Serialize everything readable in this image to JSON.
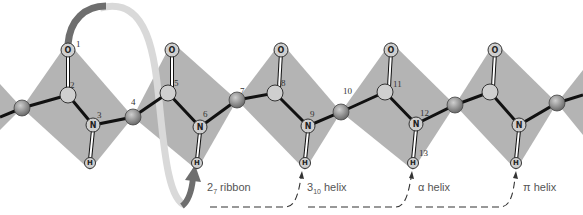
{
  "figure": {
    "atom_labels": {
      "oxygen": "O",
      "nitrogen": "N",
      "hydrogen": "H"
    },
    "atom_numbers": [
      "1",
      "2",
      "3",
      "4",
      "5",
      "6",
      "7",
      "8",
      "9",
      "10",
      "11",
      "12",
      "13"
    ],
    "structures": [
      {
        "name": "ribbon",
        "base": "2",
        "sub": "7",
        "suffix": " ribbon"
      },
      {
        "name": "helix-3-10",
        "base": "3",
        "sub": "10",
        "suffix": " helix"
      },
      {
        "name": "alpha-helix",
        "label": "α helix"
      },
      {
        "name": "pi-helix",
        "label": "π helix"
      }
    ],
    "colors": {
      "plane": "#b4b4b4",
      "bond": "#111111",
      "ribbon_dark": "#6e6e6e",
      "ribbon_light": "#d6d6d6",
      "atom_fill": "#cfcfcf",
      "calpha_fill": "#8c8c8c"
    }
  }
}
